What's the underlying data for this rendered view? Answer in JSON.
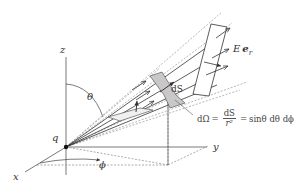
{
  "figure": {
    "type": "solid-angle-flux-diagram",
    "labels": {
      "z_axis": "z",
      "y_axis": "y",
      "x_axis": "x",
      "charge": "q",
      "polar_angle": "θ",
      "azimuth_angle": "ϕ",
      "area_element": "dS",
      "field_E": "E",
      "field_unit": "e",
      "field_unit_sub": "r"
    },
    "formula": {
      "lhs": "dΩ",
      "eq1": "=",
      "frac_num": "dS",
      "frac_den": "r²",
      "eq2": "=",
      "rhs": "sinθ dθ dϕ"
    },
    "colors": {
      "line": "#333333",
      "dashed": "#999999",
      "patch_fill": "#c8c8c8",
      "background": "#ffffff"
    }
  }
}
